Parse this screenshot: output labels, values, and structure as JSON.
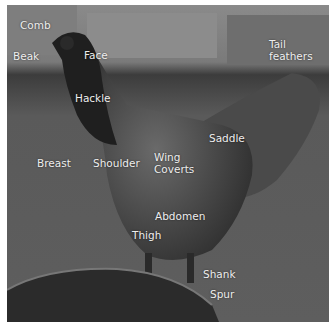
{
  "diagram": {
    "labels": [
      {
        "id": "comb",
        "text": "Comb",
        "x": 20,
        "y": 19
      },
      {
        "id": "beak",
        "text": "Beak",
        "x": 13,
        "y": 50
      },
      {
        "id": "face",
        "text": "Face",
        "x": 84,
        "y": 49
      },
      {
        "id": "hackle",
        "text": "Hackle",
        "x": 75,
        "y": 92
      },
      {
        "id": "tail-feathers",
        "text": "Tail\nfeathers",
        "x": 269,
        "y": 38
      },
      {
        "id": "breast",
        "text": "Breast",
        "x": 37,
        "y": 157
      },
      {
        "id": "shoulder",
        "text": "Shoulder",
        "x": 93,
        "y": 157
      },
      {
        "id": "saddle",
        "text": "Saddle",
        "x": 209,
        "y": 132
      },
      {
        "id": "wing-coverts",
        "text": "Wing\nCoverts",
        "x": 154,
        "y": 151
      },
      {
        "id": "abdomen",
        "text": "Abdomen",
        "x": 155,
        "y": 210
      },
      {
        "id": "thigh",
        "text": "Thigh",
        "x": 132,
        "y": 229
      },
      {
        "id": "shank",
        "text": "Shank",
        "x": 203,
        "y": 268
      },
      {
        "id": "spur",
        "text": "Spur",
        "x": 210,
        "y": 288
      }
    ]
  }
}
